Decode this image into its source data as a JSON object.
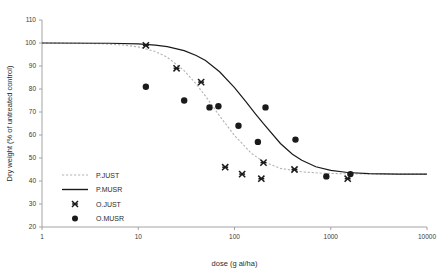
{
  "chart_data": {
    "type": "scatter",
    "title": "",
    "xlabel": "dose (g ai/ha)",
    "ylabel": "Dry weight (% of untreated control)",
    "xscale": "log",
    "xlim": [
      1,
      10000
    ],
    "ylim": [
      20,
      110
    ],
    "xticks": [
      1,
      10,
      100,
      1000,
      10000
    ],
    "xtick_labels": [
      "1",
      "10",
      "100",
      "1000",
      "10000"
    ],
    "yticks": [
      20,
      30,
      40,
      50,
      60,
      70,
      80,
      90,
      100,
      110
    ],
    "ytick_labels": [
      "20",
      "30",
      "40",
      "50",
      "60",
      "70",
      "80",
      "90",
      "100",
      "110"
    ],
    "grid": false,
    "legend_position": "lower-left-inside",
    "series": [
      {
        "name": "P.JUST",
        "kind": "line",
        "style": "dotted",
        "color": "#b4b4b4",
        "marker": "none",
        "model": "log-logistic",
        "params": {
          "top": 100,
          "bottom": 43,
          "ed50": 70,
          "slope": 2.3
        },
        "points": [
          {
            "x": 1,
            "y": 100.0
          },
          {
            "x": 2,
            "y": 99.9
          },
          {
            "x": 4,
            "y": 99.7
          },
          {
            "x": 7,
            "y": 99.1
          },
          {
            "x": 10,
            "y": 98.3
          },
          {
            "x": 15,
            "y": 96.3
          },
          {
            "x": 20,
            "y": 93.8
          },
          {
            "x": 30,
            "y": 88.0
          },
          {
            "x": 40,
            "y": 82.2
          },
          {
            "x": 50,
            "y": 76.9
          },
          {
            "x": 70,
            "y": 68.3
          },
          {
            "x": 100,
            "y": 59.8
          },
          {
            "x": 150,
            "y": 52.0
          },
          {
            "x": 200,
            "y": 48.4
          },
          {
            "x": 300,
            "y": 45.5
          },
          {
            "x": 500,
            "y": 44.0
          },
          {
            "x": 800,
            "y": 43.4
          },
          {
            "x": 1500,
            "y": 43.1
          },
          {
            "x": 3000,
            "y": 43.0
          },
          {
            "x": 10000,
            "y": 43.0
          }
        ]
      },
      {
        "name": "P.MUSR",
        "kind": "line",
        "style": "solid",
        "color": "#1a1a1a",
        "marker": "none",
        "model": "log-logistic",
        "params": {
          "top": 100,
          "bottom": 43,
          "ed50": 165,
          "slope": 2.2
        },
        "points": [
          {
            "x": 1,
            "y": 100.0
          },
          {
            "x": 5,
            "y": 99.9
          },
          {
            "x": 10,
            "y": 99.6
          },
          {
            "x": 15,
            "y": 99.1
          },
          {
            "x": 20,
            "y": 98.4
          },
          {
            "x": 30,
            "y": 96.7
          },
          {
            "x": 40,
            "y": 94.6
          },
          {
            "x": 50,
            "y": 92.4
          },
          {
            "x": 70,
            "y": 87.5
          },
          {
            "x": 100,
            "y": 80.6
          },
          {
            "x": 130,
            "y": 74.7
          },
          {
            "x": 165,
            "y": 69.2
          },
          {
            "x": 200,
            "y": 64.9
          },
          {
            "x": 300,
            "y": 56.3
          },
          {
            "x": 400,
            "y": 51.6
          },
          {
            "x": 500,
            "y": 49.0
          },
          {
            "x": 700,
            "y": 46.2
          },
          {
            "x": 1000,
            "y": 44.6
          },
          {
            "x": 1500,
            "y": 43.7
          },
          {
            "x": 2500,
            "y": 43.2
          },
          {
            "x": 5000,
            "y": 43.0
          },
          {
            "x": 10000,
            "y": 43.0
          }
        ]
      },
      {
        "name": "O.JUST",
        "kind": "scatter",
        "marker": "x-star",
        "color": "#1a1a1a",
        "points": [
          {
            "x": 12,
            "y": 99
          },
          {
            "x": 25,
            "y": 89
          },
          {
            "x": 45,
            "y": 83
          },
          {
            "x": 80,
            "y": 46
          },
          {
            "x": 120,
            "y": 43
          },
          {
            "x": 190,
            "y": 41
          },
          {
            "x": 200,
            "y": 48
          },
          {
            "x": 420,
            "y": 45
          },
          {
            "x": 1500,
            "y": 41
          }
        ]
      },
      {
        "name": "O.MUSR",
        "kind": "scatter",
        "marker": "circle",
        "color": "#1a1a1a",
        "points": [
          {
            "x": 12,
            "y": 81
          },
          {
            "x": 30,
            "y": 75
          },
          {
            "x": 55,
            "y": 72
          },
          {
            "x": 68,
            "y": 72.5
          },
          {
            "x": 110,
            "y": 64
          },
          {
            "x": 175,
            "y": 57
          },
          {
            "x": 210,
            "y": 72
          },
          {
            "x": 430,
            "y": 58
          },
          {
            "x": 900,
            "y": 42
          },
          {
            "x": 1600,
            "y": 43
          }
        ]
      }
    ]
  },
  "legend": {
    "items": [
      {
        "label": "P.JUST",
        "kind": "line",
        "style": "dotted",
        "color": "#b4b4b4"
      },
      {
        "label": "P.MUSR",
        "kind": "line",
        "style": "solid",
        "color": "#1a1a1a"
      },
      {
        "label": "O.JUST",
        "kind": "marker",
        "marker": "x-star",
        "color": "#1a1a1a"
      },
      {
        "label": "O.MUSR",
        "kind": "marker",
        "marker": "circle",
        "color": "#1a1a1a"
      }
    ]
  }
}
